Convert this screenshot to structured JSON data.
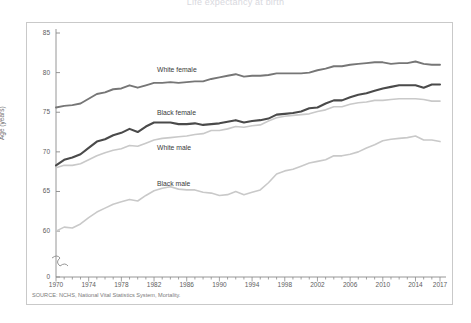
{
  "figure": {
    "title": "Life expectancy at birth",
    "source": "SOURCE: NCHS, National Vital Statistics System, Mortality."
  },
  "chart_data": {
    "type": "line",
    "title": "Life expectancy at birth",
    "xlabel": "",
    "ylabel": "Age (years)",
    "xlim": [
      1970,
      2017
    ],
    "ylim": [
      58.5,
      85
    ],
    "ytick_labels": [
      "0",
      "60",
      "65",
      "70",
      "75",
      "80",
      "85"
    ],
    "axis_break": true,
    "grid": false,
    "legend": "inline-labels",
    "xtick_labels": [
      1970,
      1974,
      1978,
      1982,
      1986,
      1990,
      1994,
      1998,
      2002,
      2006,
      2010,
      2014,
      2017
    ],
    "x": [
      1970,
      1971,
      1972,
      1973,
      1974,
      1975,
      1976,
      1977,
      1978,
      1979,
      1980,
      1981,
      1982,
      1983,
      1984,
      1985,
      1986,
      1987,
      1988,
      1989,
      1990,
      1991,
      1992,
      1993,
      1994,
      1995,
      1996,
      1997,
      1998,
      1999,
      2000,
      2001,
      2002,
      2003,
      2004,
      2005,
      2006,
      2007,
      2008,
      2009,
      2010,
      2011,
      2012,
      2013,
      2014,
      2015,
      2016,
      2017
    ],
    "series": [
      {
        "name": "White female",
        "color": "#767676",
        "values": [
          75.6,
          75.8,
          75.9,
          76.1,
          76.7,
          77.3,
          77.5,
          77.9,
          78.0,
          78.4,
          78.1,
          78.4,
          78.7,
          78.7,
          78.8,
          78.7,
          78.8,
          78.9,
          78.9,
          79.2,
          79.4,
          79.6,
          79.8,
          79.5,
          79.6,
          79.6,
          79.7,
          79.9,
          79.9,
          79.9,
          79.9,
          80.0,
          80.3,
          80.5,
          80.8,
          80.8,
          81.0,
          81.1,
          81.2,
          81.3,
          81.3,
          81.1,
          81.2,
          81.2,
          81.4,
          81.1,
          81.0,
          81.0
        ]
      },
      {
        "name": "Black female",
        "color": "#4a4a4a",
        "values": [
          68.3,
          69.0,
          69.3,
          69.7,
          70.5,
          71.3,
          71.6,
          72.1,
          72.4,
          72.9,
          72.5,
          73.2,
          73.7,
          73.7,
          73.7,
          73.5,
          73.5,
          73.6,
          73.4,
          73.5,
          73.6,
          73.8,
          74.0,
          73.7,
          73.9,
          74.0,
          74.2,
          74.7,
          74.8,
          74.9,
          75.1,
          75.5,
          75.6,
          76.1,
          76.5,
          76.5,
          76.9,
          77.2,
          77.4,
          77.7,
          78.0,
          78.2,
          78.4,
          78.4,
          78.4,
          78.1,
          78.5,
          78.5
        ]
      },
      {
        "name": "White male",
        "color": "#c9c9c9",
        "values": [
          68.0,
          68.3,
          68.3,
          68.5,
          69.0,
          69.5,
          69.9,
          70.2,
          70.4,
          70.8,
          70.7,
          71.1,
          71.5,
          71.7,
          71.8,
          71.9,
          72.0,
          72.2,
          72.3,
          72.7,
          72.7,
          72.9,
          73.2,
          73.1,
          73.3,
          73.4,
          73.9,
          74.3,
          74.5,
          74.6,
          74.7,
          74.8,
          75.1,
          75.3,
          75.7,
          75.7,
          76.0,
          76.2,
          76.3,
          76.5,
          76.5,
          76.6,
          76.7,
          76.7,
          76.7,
          76.6,
          76.4,
          76.4
        ]
      },
      {
        "name": "Black male",
        "color": "#c9c9c9",
        "values": [
          60.0,
          60.5,
          60.4,
          60.9,
          61.7,
          62.4,
          62.9,
          63.4,
          63.7,
          64.0,
          63.8,
          64.5,
          65.1,
          65.4,
          65.6,
          65.3,
          65.2,
          65.2,
          64.9,
          64.8,
          64.5,
          64.6,
          65.0,
          64.6,
          64.9,
          65.2,
          66.1,
          67.2,
          67.6,
          67.8,
          68.2,
          68.6,
          68.8,
          69.0,
          69.5,
          69.5,
          69.7,
          70.0,
          70.5,
          70.9,
          71.4,
          71.6,
          71.7,
          71.8,
          72.0,
          71.5,
          71.5,
          71.3
        ]
      }
    ]
  },
  "axis": {
    "yticks": [
      {
        "label": "85",
        "value": 85
      },
      {
        "label": "80",
        "value": 80
      },
      {
        "label": "75",
        "value": 75
      },
      {
        "label": "70",
        "value": 70
      },
      {
        "label": "65",
        "value": 65
      },
      {
        "label": "60",
        "value": 60
      },
      {
        "label": "0",
        "value": 0
      }
    ],
    "xticks": [
      "1970",
      "1974",
      "1978",
      "1982",
      "1986",
      "1990",
      "1994",
      "1998",
      "2002",
      "2006",
      "2010",
      "2014",
      "2017"
    ],
    "ylabel": "Age (years)"
  },
  "series_labels": [
    {
      "name": "White female",
      "text": "White female"
    },
    {
      "name": "Black female",
      "text": "Black female"
    },
    {
      "name": "White male",
      "text": "White male"
    },
    {
      "name": "Black male",
      "text": "Black male"
    }
  ]
}
